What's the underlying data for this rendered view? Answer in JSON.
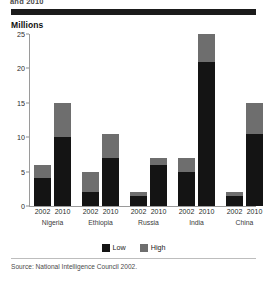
{
  "header": {
    "clipped_heading": "and 2010",
    "unit_label": "Millions"
  },
  "legend": {
    "items": [
      {
        "label": "Low",
        "color": "#141414"
      },
      {
        "label": "High",
        "color": "#6e6e6e"
      }
    ]
  },
  "footer": {
    "source": "Source: National Intelligence Council 2002."
  },
  "chart_data": {
    "type": "bar",
    "title": "Millions",
    "xlabel": "",
    "ylabel": "Millions",
    "ylim": [
      0,
      25
    ],
    "yticks": [
      0,
      5,
      10,
      15,
      20,
      25
    ],
    "grid": false,
    "stacked": true,
    "legend_position": "bottom-center",
    "groups": [
      "Nigeria",
      "Ethiopia",
      "Russia",
      "India",
      "China"
    ],
    "categories": [
      "2002",
      "2010",
      "2002",
      "2010",
      "2002",
      "2010",
      "2002",
      "2010",
      "2002",
      "2010"
    ],
    "series": [
      {
        "name": "Low",
        "color": "#141414",
        "values": [
          4,
          10,
          2,
          7,
          1.5,
          6,
          5,
          21,
          1.5,
          10.5
        ]
      },
      {
        "name": "High",
        "color": "#6e6e6e",
        "values": [
          2,
          5,
          3,
          3.5,
          0.5,
          1,
          2,
          4,
          0.5,
          4.5
        ]
      }
    ],
    "totals": [
      6,
      15,
      5,
      10.5,
      2,
      7,
      7,
      25,
      2,
      15
    ],
    "annotations": []
  }
}
